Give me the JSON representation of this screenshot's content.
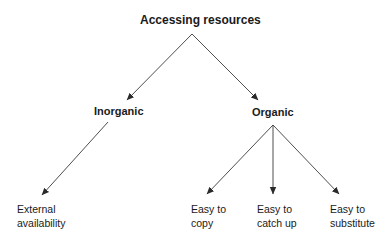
{
  "diagram": {
    "title": "Accessing resources",
    "colors": {
      "line": "#3a3a3a",
      "text": "#1a1a1a",
      "background": "#ffffff"
    },
    "root": {
      "id": "accessing-resources",
      "label": "Accessing resources"
    },
    "branches": [
      {
        "id": "inorganic",
        "label": "Inorganic",
        "children": [
          {
            "id": "external-availability",
            "line1": "External",
            "line2": "availability",
            "label": "External availability"
          }
        ]
      },
      {
        "id": "organic",
        "label": "Organic",
        "children": [
          {
            "id": "easy-to-copy",
            "line1": "Easy to",
            "line2": "copy",
            "label": "Easy to copy"
          },
          {
            "id": "easy-to-catch-up",
            "line1": "Easy to",
            "line2": "catch up",
            "label": "Easy to catch up"
          },
          {
            "id": "easy-to-substitute",
            "line1": "Easy to",
            "line2": "substitute",
            "label": "Easy to substitute"
          }
        ]
      }
    ],
    "edges": [
      {
        "from": "accessing-resources",
        "to": "inorganic"
      },
      {
        "from": "accessing-resources",
        "to": "organic"
      },
      {
        "from": "inorganic",
        "to": "external-availability"
      },
      {
        "from": "organic",
        "to": "easy-to-copy"
      },
      {
        "from": "organic",
        "to": "easy-to-catch-up"
      },
      {
        "from": "organic",
        "to": "easy-to-substitute"
      }
    ]
  }
}
